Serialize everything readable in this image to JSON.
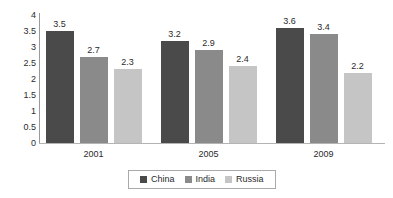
{
  "chart_data": {
    "type": "bar",
    "title": "",
    "subtitle": "",
    "xlabel": "",
    "ylabel": "",
    "categories": [
      "2001",
      "2005",
      "2009"
    ],
    "series": [
      {
        "name": "China",
        "values": [
          3.5,
          3.2,
          3.6
        ],
        "color": "#4a4a4a"
      },
      {
        "name": "India",
        "values": [
          2.7,
          2.9,
          3.4
        ],
        "color": "#8a8a8a"
      },
      {
        "name": "Russia",
        "values": [
          2.3,
          2.4,
          2.2
        ],
        "color": "#c5c5c5"
      }
    ],
    "ylim": [
      0,
      4
    ],
    "ytick_labels": [
      "0",
      "0.5",
      "1",
      "1.5",
      "2",
      "2.5",
      "3",
      "3.5",
      "4"
    ],
    "ytick_values": [
      0,
      0.5,
      1,
      1.5,
      2,
      2.5,
      3,
      3.5,
      4
    ],
    "data_labels": [
      "3.5",
      "2.7",
      "2.3",
      "3.2",
      "2.9",
      "2.4",
      "3.6",
      "3.4",
      "2.2"
    ],
    "grid": false,
    "legend_position": "bottom",
    "legend_entries": [
      "China",
      "India",
      "Russia"
    ]
  }
}
